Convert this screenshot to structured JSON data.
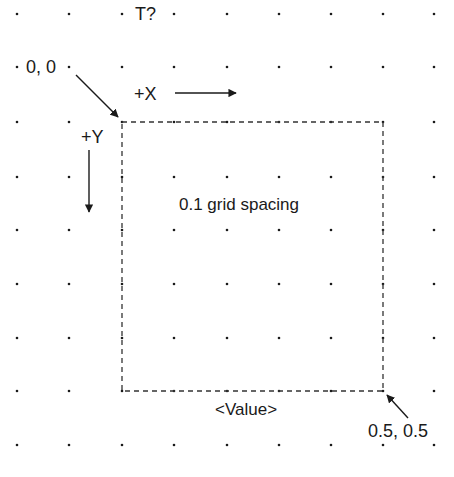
{
  "diagram": {
    "title_label": "T?",
    "origin_label": "0, 0",
    "x_axis_label": "+X",
    "y_axis_label": "+Y",
    "spacing_label": "0.1 grid spacing",
    "value_label": "<Value>",
    "corner_label": "0.5, 0.5",
    "colors": {
      "ink": "#1a1a1a",
      "background": "#ffffff",
      "dash": "#333333"
    },
    "grid": {
      "xs": [
        17,
        69,
        122,
        174,
        227,
        279,
        331,
        383,
        434
      ],
      "ys": [
        14,
        67,
        122,
        177,
        230,
        284,
        338,
        391,
        445
      ]
    },
    "box": {
      "x1": 122,
      "y1": 122,
      "x2": 383,
      "y2": 391
    }
  }
}
